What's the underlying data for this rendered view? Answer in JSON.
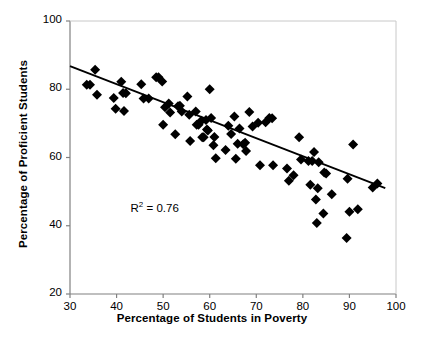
{
  "chart_data": {
    "type": "scatter",
    "title": "",
    "xlabel": "Percentage of Students in Poverty",
    "ylabel": "Percentage of Proficient Students",
    "xlim": [
      30,
      100
    ],
    "ylim": [
      20,
      100
    ],
    "xticks": [
      30,
      40,
      50,
      60,
      70,
      80,
      90,
      100
    ],
    "yticks": [
      20,
      40,
      60,
      80,
      100
    ],
    "grid": false,
    "legend": null,
    "annotations": [
      {
        "name": "r-squared",
        "text": "R2 = 0.76",
        "display_prefix": "R",
        "display_exponent": "2",
        "display_suffix": " = 0.76",
        "x": 43,
        "y": 44.5
      }
    ],
    "marker": {
      "shape": "diamond",
      "color": "#000000",
      "size": 5
    },
    "trendline": {
      "name": "linear-regression-line",
      "color": "#000000",
      "width": 1.8,
      "x_start": 30,
      "y_start": 86.8,
      "x_end": 97.7,
      "y_end": 51.0,
      "slope": -0.529,
      "intercept": 102.7,
      "r_squared": 0.76
    },
    "points": [
      [
        33.6,
        81.3
      ],
      [
        34.3,
        81.3
      ],
      [
        35.4,
        85.7
      ],
      [
        35.8,
        78.4
      ],
      [
        39.4,
        77.4
      ],
      [
        39.8,
        74.3
      ],
      [
        41.0,
        82.2
      ],
      [
        41.4,
        78.9
      ],
      [
        41.6,
        73.6
      ],
      [
        42.0,
        78.8
      ],
      [
        45.3,
        81.5
      ],
      [
        45.8,
        77.3
      ],
      [
        46.9,
        77.3
      ],
      [
        48.5,
        83.5
      ],
      [
        49.0,
        83.5
      ],
      [
        49.8,
        82.3
      ],
      [
        50.0,
        69.6
      ],
      [
        50.4,
        74.7
      ],
      [
        51.2,
        75.8
      ],
      [
        51.5,
        73.2
      ],
      [
        52.6,
        66.8
      ],
      [
        53.2,
        75.0
      ],
      [
        53.6,
        75.2
      ],
      [
        54.0,
        73.5
      ],
      [
        55.2,
        77.9
      ],
      [
        55.6,
        72.5
      ],
      [
        55.8,
        64.8
      ],
      [
        57.0,
        73.5
      ],
      [
        57.2,
        69.6
      ],
      [
        57.6,
        69.6
      ],
      [
        58.2,
        70.8
      ],
      [
        58.4,
        65.9
      ],
      [
        58.7,
        65.9
      ],
      [
        59.2,
        71.0
      ],
      [
        59.4,
        68.2
      ],
      [
        59.6,
        67.9
      ],
      [
        60.0,
        80.0
      ],
      [
        60.3,
        71.6
      ],
      [
        60.8,
        63.6
      ],
      [
        61.0,
        66.0
      ],
      [
        61.3,
        59.8
      ],
      [
        63.4,
        62.2
      ],
      [
        64.0,
        69.3
      ],
      [
        64.6,
        66.9
      ],
      [
        65.3,
        72.0
      ],
      [
        65.6,
        59.6
      ],
      [
        66.0,
        64.0
      ],
      [
        66.4,
        68.5
      ],
      [
        67.2,
        63.9
      ],
      [
        67.6,
        64.3
      ],
      [
        67.8,
        61.9
      ],
      [
        68.5,
        73.3
      ],
      [
        69.2,
        69.1
      ],
      [
        70.4,
        70.2
      ],
      [
        70.8,
        57.7
      ],
      [
        72.0,
        70.3
      ],
      [
        72.8,
        71.6
      ],
      [
        73.4,
        71.5
      ],
      [
        73.6,
        57.7
      ],
      [
        76.6,
        56.8
      ],
      [
        77.0,
        53.2
      ],
      [
        78.0,
        54.8
      ],
      [
        79.2,
        65.9
      ],
      [
        79.6,
        59.4
      ],
      [
        81.2,
        59.0
      ],
      [
        81.6,
        52.0
      ],
      [
        82.0,
        59.0
      ],
      [
        82.4,
        61.6
      ],
      [
        82.8,
        47.7
      ],
      [
        83.0,
        40.8
      ],
      [
        83.2,
        51.0
      ],
      [
        83.4,
        58.6
      ],
      [
        84.4,
        43.6
      ],
      [
        84.6,
        55.6
      ],
      [
        85.0,
        55.3
      ],
      [
        86.2,
        49.2
      ],
      [
        89.4,
        36.4
      ],
      [
        89.6,
        53.8
      ],
      [
        90.0,
        44.1
      ],
      [
        90.8,
        63.8
      ],
      [
        91.8,
        44.8
      ],
      [
        95.0,
        51.2
      ],
      [
        96.0,
        52.4
      ]
    ]
  },
  "axes": {
    "x_tick_labels": [
      "30",
      "40",
      "50",
      "60",
      "70",
      "80",
      "90",
      "100"
    ],
    "y_tick_labels": [
      "20",
      "40",
      "60",
      "80",
      "100"
    ]
  },
  "colors": {
    "marker": "#000000",
    "line": "#000000",
    "axis": "#808080",
    "text": "#000000",
    "background": "#ffffff"
  }
}
